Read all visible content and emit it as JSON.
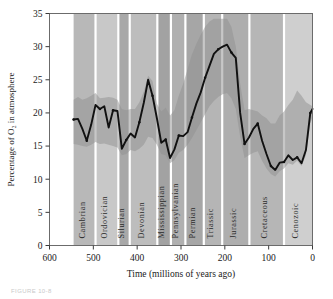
{
  "figure": {
    "caption": "FIGURE 10-8"
  },
  "chart_data": {
    "type": "line",
    "title": "",
    "xlabel": "Time (millions of years ago)",
    "ylabel": "Percentage of O2 in atmosphere",
    "ylabel_display": "Percentage of O₂ in atmosphere",
    "xlim": [
      600,
      0
    ],
    "ylim": [
      0,
      35
    ],
    "x_reversed": true,
    "grid": false,
    "legend": "none",
    "xticks": [
      600,
      500,
      400,
      300,
      200,
      100,
      0
    ],
    "yticks": [
      0,
      5,
      10,
      15,
      20,
      25,
      30,
      35
    ],
    "series": [
      {
        "name": "Atmospheric O2 (best estimate)",
        "color": "#111111",
        "x": [
          545,
          535,
          525,
          515,
          505,
          495,
          485,
          475,
          465,
          455,
          445,
          435,
          425,
          415,
          405,
          395,
          385,
          375,
          365,
          355,
          345,
          335,
          325,
          315,
          305,
          295,
          285,
          275,
          265,
          255,
          245,
          235,
          225,
          215,
          205,
          195,
          185,
          175,
          165,
          155,
          145,
          135,
          125,
          115,
          105,
          95,
          85,
          75,
          65,
          55,
          45,
          35,
          25,
          15,
          5,
          0
        ],
        "values": [
          19.0,
          19.1,
          17.6,
          15.8,
          18.2,
          21.2,
          20.6,
          21.0,
          17.8,
          20.4,
          20.3,
          14.6,
          15.9,
          16.9,
          16.3,
          18.6,
          21.5,
          25.0,
          22.6,
          19.2,
          15.5,
          16.0,
          13.2,
          14.5,
          16.6,
          16.5,
          17.1,
          19.3,
          21.4,
          23.1,
          25.3,
          27.1,
          28.9,
          29.6,
          30.0,
          30.3,
          29.1,
          28.3,
          20.0,
          15.3,
          16.3,
          17.6,
          18.4,
          15.8,
          13.8,
          12.0,
          11.4,
          12.5,
          12.6,
          13.6,
          12.9,
          13.3,
          12.4,
          14.4,
          20.0,
          20.6
        ]
      }
    ],
    "uncertainty_band": {
      "name": "Uncertainty envelope",
      "color": "#9a9a9a",
      "opacity": 0.55,
      "upper": [
        22.0,
        22.4,
        22.0,
        22.2,
        22.6,
        23.0,
        22.2,
        22.3,
        22.4,
        22.3,
        22.0,
        20.6,
        20.4,
        20.6,
        20.6,
        21.6,
        23.2,
        25.6,
        24.8,
        21.4,
        20.2,
        20.8,
        19.6,
        20.4,
        22.6,
        24.4,
        26.6,
        28.8,
        30.4,
        31.8,
        33.0,
        33.8,
        34.2,
        34.2,
        34.2,
        34.2,
        33.0,
        30.0,
        24.4,
        20.4,
        20.6,
        20.4,
        20.2,
        19.6,
        19.2,
        18.4,
        18.4,
        19.6,
        20.2,
        21.2,
        22.0,
        23.4,
        22.6,
        21.6,
        21.2,
        21.0
      ],
      "lower": [
        15.3,
        15.2,
        15.0,
        14.9,
        15.2,
        15.6,
        15.3,
        15.4,
        15.2,
        15.0,
        14.8,
        13.6,
        13.8,
        14.4,
        14.2,
        14.6,
        15.2,
        16.4,
        16.2,
        15.2,
        13.8,
        13.6,
        12.4,
        12.9,
        14.0,
        14.4,
        15.2,
        16.2,
        17.4,
        18.6,
        19.8,
        21.0,
        21.8,
        22.4,
        22.8,
        23.0,
        22.2,
        20.6,
        16.4,
        13.2,
        13.6,
        14.0,
        14.2,
        12.8,
        11.6,
        10.8,
        10.4,
        11.2,
        11.6,
        12.4,
        12.2,
        12.8,
        12.0,
        13.6,
        18.4,
        19.4
      ]
    },
    "geologic_periods": [
      {
        "label": "Cambrian",
        "start": 545,
        "end": 495,
        "shade": "#b8b8b8"
      },
      {
        "label": "Ordovician",
        "start": 495,
        "end": 443,
        "shade": "#c8c8c8"
      },
      {
        "label": "Silurian",
        "start": 443,
        "end": 417,
        "shade": "#a8a8a8"
      },
      {
        "label": "Devonian",
        "start": 417,
        "end": 354,
        "shade": "#bdbdbd"
      },
      {
        "label": "Mississippian",
        "start": 354,
        "end": 323,
        "shade": "#a2a2a2"
      },
      {
        "label": "Pennsylvanian",
        "start": 323,
        "end": 290,
        "shade": "#b0b0b0"
      },
      {
        "label": "Permian",
        "start": 290,
        "end": 248,
        "shade": "#a6a6a6"
      },
      {
        "label": "Triassic",
        "start": 248,
        "end": 206,
        "shade": "#b5b5b5"
      },
      {
        "label": "Jurassic",
        "start": 206,
        "end": 144,
        "shade": "#aeaeae"
      },
      {
        "label": "Cretaceous",
        "start": 144,
        "end": 65,
        "shade": "#b6b6b6"
      },
      {
        "label": "Cenozoic",
        "start": 65,
        "end": 0,
        "shade": "#cfcfcf"
      }
    ]
  }
}
